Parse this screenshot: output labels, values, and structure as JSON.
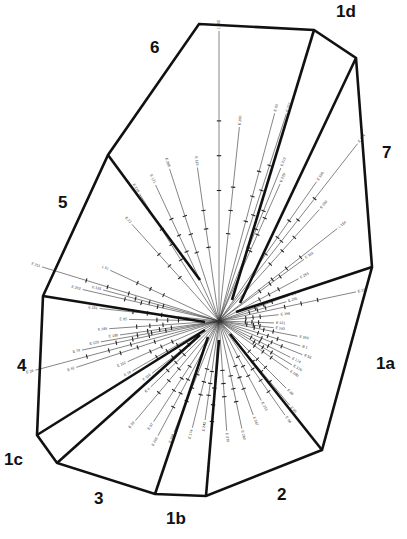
{
  "diagram": {
    "type": "radial-sector-diagram",
    "center": [
      219,
      321
    ],
    "outline": [
      [
        199,
        24
      ],
      [
        314,
        30
      ],
      [
        356,
        58
      ],
      [
        372,
        267
      ],
      [
        322,
        450
      ],
      [
        206,
        496
      ],
      [
        155,
        494
      ],
      [
        57,
        463
      ],
      [
        37,
        435
      ],
      [
        43,
        296
      ],
      [
        108,
        155
      ]
    ],
    "boundaries": [
      {
        "from": [
          314,
          30
        ],
        "to": [
          232,
          300
        ]
      },
      {
        "from": [
          356,
          58
        ],
        "to": [
          240,
          303
        ]
      },
      {
        "from": [
          372,
          267
        ],
        "to": [
          236,
          312
        ]
      },
      {
        "from": [
          322,
          450
        ],
        "to": [
          230,
          334
        ]
      },
      {
        "from": [
          206,
          496
        ],
        "to": [
          219,
          340
        ]
      },
      {
        "from": [
          155,
          494
        ],
        "to": [
          208,
          337
        ]
      },
      {
        "from": [
          57,
          463
        ],
        "to": [
          200,
          335
        ]
      },
      {
        "from": [
          37,
          435
        ],
        "to": [
          205,
          330
        ]
      },
      {
        "from": [
          43,
          296
        ],
        "to": [
          205,
          322
        ]
      },
      {
        "from": [
          108,
          155
        ],
        "to": [
          200,
          280
        ]
      }
    ],
    "sectors": [
      {
        "id": "1a",
        "label": "1a",
        "x": 376,
        "y": 355
      },
      {
        "id": "1b",
        "label": "1b",
        "x": 166,
        "y": 510
      },
      {
        "id": "1c",
        "label": "1c",
        "x": 4,
        "y": 451
      },
      {
        "id": "1d",
        "label": "1d",
        "x": 336,
        "y": 3
      },
      {
        "id": "2",
        "label": "2",
        "x": 277,
        "y": 486
      },
      {
        "id": "3",
        "label": "3",
        "x": 94,
        "y": 490
      },
      {
        "id": "4",
        "label": "4",
        "x": 17,
        "y": 357
      },
      {
        "id": "5",
        "label": "5",
        "x": 58,
        "y": 194
      },
      {
        "id": "6",
        "label": "6",
        "x": 150,
        "y": 39
      },
      {
        "id": "7",
        "label": "7",
        "x": 382,
        "y": 144
      }
    ],
    "leaf_labels": [
      {
        "text": "L 190",
        "angle": -90,
        "len": 290
      },
      {
        "text": "E 63",
        "angle": -75,
        "len": 215
      },
      {
        "text": "E 222",
        "angle": -72,
        "len": 218
      },
      {
        "text": "E 260",
        "angle": -84,
        "len": 195
      },
      {
        "text": "E 212",
        "angle": -68,
        "len": 165
      },
      {
        "text": "E 229",
        "angle": -66,
        "len": 150
      },
      {
        "text": "E 174",
        "angle": -52,
        "len": 225
      },
      {
        "text": "E 190",
        "angle": -55,
        "len": 170
      },
      {
        "text": "E 200",
        "angle": -48,
        "len": 150
      },
      {
        "text": "L 154",
        "angle": -38,
        "len": 150
      },
      {
        "text": "E 102",
        "angle": -36,
        "len": 105
      },
      {
        "text": "E 253",
        "angle": -28,
        "len": 90
      },
      {
        "text": "E 265",
        "angle": -16,
        "len": 70
      },
      {
        "text": "E 221",
        "angle": -12,
        "len": 140
      },
      {
        "text": "E 248",
        "angle": -20,
        "len": 75
      },
      {
        "text": "E 198",
        "angle": -6,
        "len": 60
      },
      {
        "text": "E 121",
        "angle": 2,
        "len": 55
      },
      {
        "text": "E 162",
        "angle": 7,
        "len": 55
      },
      {
        "text": "E 560",
        "angle": 11,
        "len": 80
      },
      {
        "text": "B 1",
        "angle": 17,
        "len": 85
      },
      {
        "text": "E 56",
        "angle": 22,
        "len": 90
      },
      {
        "text": "E 174",
        "angle": 27,
        "len": 80
      },
      {
        "text": "E 176",
        "angle": 31,
        "len": 85
      },
      {
        "text": "E 180",
        "angle": 35,
        "len": 85
      },
      {
        "text": "E 86",
        "angle": 45,
        "len": 95
      },
      {
        "text": "E 95",
        "angle": 50,
        "len": 110
      },
      {
        "text": "E 96",
        "angle": 55,
        "len": 115
      },
      {
        "text": "E 213",
        "angle": 62,
        "len": 90
      },
      {
        "text": "E 247",
        "angle": 70,
        "len": 100
      },
      {
        "text": "E 280",
        "angle": 78,
        "len": 110
      },
      {
        "text": "E 270",
        "angle": 86,
        "len": 110
      },
      {
        "text": "E 244",
        "angle": 94,
        "len": 140
      },
      {
        "text": "E 243",
        "angle": 98,
        "len": 100
      },
      {
        "text": "E 174",
        "angle": 104,
        "len": 110
      },
      {
        "text": "E 248",
        "angle": 112,
        "len": 120
      },
      {
        "text": "E 265",
        "angle": 118,
        "len": 130
      },
      {
        "text": "E 97",
        "angle": 123,
        "len": 120
      },
      {
        "text": "E 59",
        "angle": 130,
        "len": 130
      },
      {
        "text": "E 4",
        "angle": 136,
        "len": 95
      },
      {
        "text": "E 116",
        "angle": 142,
        "len": 85
      },
      {
        "text": "E 19",
        "angle": 150,
        "len": 100
      },
      {
        "text": "E 112",
        "angle": 156,
        "len": 100
      },
      {
        "text": "E 42",
        "angle": 162,
        "len": 150
      },
      {
        "text": "E 29",
        "angle": 165,
        "len": 190
      },
      {
        "text": "E 79",
        "angle": 168,
        "len": 140
      },
      {
        "text": "E 120",
        "angle": 170,
        "len": 120
      },
      {
        "text": "E 188",
        "angle": 172,
        "len": 100
      },
      {
        "text": "E 185",
        "angle": 176,
        "len": 110
      },
      {
        "text": "E 85",
        "angle": 181,
        "len": 90
      },
      {
        "text": "E 151",
        "angle": 186,
        "len": 120
      },
      {
        "text": "E 211",
        "angle": 197,
        "len": 185
      },
      {
        "text": "E 202",
        "angle": 193,
        "len": 140
      },
      {
        "text": "E 125",
        "angle": 195,
        "len": 120
      },
      {
        "text": "L 51",
        "angle": 205,
        "len": 120
      },
      {
        "text": "E 22",
        "angle": 228,
        "len": 130
      },
      {
        "text": "E 218",
        "angle": 238,
        "len": 150
      },
      {
        "text": "E 171",
        "angle": 245,
        "len": 150
      },
      {
        "text": "E 205",
        "angle": 252,
        "len": 160
      },
      {
        "text": "E 115",
        "angle": 262,
        "len": 155
      }
    ]
  },
  "colors": {
    "outline": "#111111",
    "branch": "#333333",
    "background": "#ffffff"
  }
}
